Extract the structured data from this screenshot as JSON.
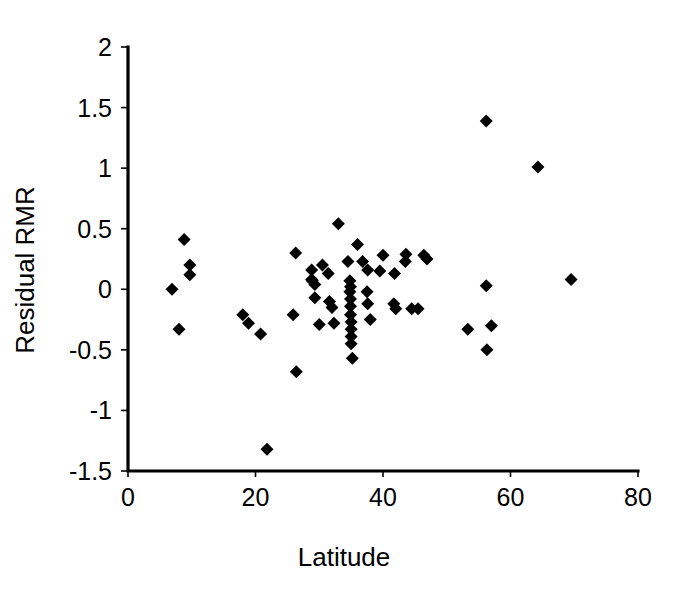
{
  "chart_data": {
    "type": "scatter",
    "title": "",
    "xlabel": "Latitude",
    "ylabel": "Residual RMR",
    "xlim": [
      0,
      80
    ],
    "ylim": [
      -1.5,
      2
    ],
    "xticks": [
      0,
      20,
      40,
      60,
      80
    ],
    "yticks": [
      -1.5,
      -1,
      -0.5,
      0,
      0.5,
      1,
      1.5,
      2
    ],
    "xtick_labels": [
      "0",
      "20",
      "40",
      "60",
      "80"
    ],
    "ytick_labels": [
      "-1.5",
      "-1",
      "-0.5",
      "0",
      "0.5",
      "1",
      "1.5",
      "2"
    ],
    "grid": false,
    "legend": false,
    "marker": "diamond",
    "marker_color": "#000000",
    "marker_size": 13,
    "series": [
      {
        "name": "Residual RMR",
        "points": [
          [
            8.8,
            0.41
          ],
          [
            9.7,
            0.2
          ],
          [
            9.7,
            0.12
          ],
          [
            6.9,
            0.0
          ],
          [
            8.0,
            -0.33
          ],
          [
            18.0,
            -0.21
          ],
          [
            18.9,
            -0.28
          ],
          [
            20.8,
            -0.37
          ],
          [
            21.8,
            -1.32
          ],
          [
            25.9,
            -0.21
          ],
          [
            26.4,
            -0.68
          ],
          [
            26.3,
            0.3
          ],
          [
            28.8,
            0.16
          ],
          [
            28.8,
            0.08
          ],
          [
            28.9,
            0.07
          ],
          [
            29.3,
            0.04
          ],
          [
            29.3,
            -0.07
          ],
          [
            30.0,
            -0.29
          ],
          [
            30.5,
            0.2
          ],
          [
            31.4,
            0.13
          ],
          [
            31.6,
            -0.1
          ],
          [
            32.0,
            -0.15
          ],
          [
            32.3,
            -0.28
          ],
          [
            33.0,
            0.54
          ],
          [
            34.5,
            0.23
          ],
          [
            34.8,
            0.07
          ],
          [
            34.9,
            0.02
          ],
          [
            34.8,
            -0.02
          ],
          [
            34.9,
            -0.08
          ],
          [
            34.9,
            -0.14
          ],
          [
            34.9,
            -0.21
          ],
          [
            35.0,
            -0.27
          ],
          [
            35.0,
            -0.33
          ],
          [
            35.0,
            -0.39
          ],
          [
            35.0,
            -0.45
          ],
          [
            35.2,
            -0.57
          ],
          [
            36.0,
            0.37
          ],
          [
            36.8,
            0.23
          ],
          [
            37.6,
            0.16
          ],
          [
            37.5,
            -0.02
          ],
          [
            37.6,
            -0.12
          ],
          [
            38.0,
            -0.25
          ],
          [
            39.5,
            0.15
          ],
          [
            40.0,
            0.28
          ],
          [
            41.8,
            0.13
          ],
          [
            41.7,
            -0.12
          ],
          [
            42.0,
            -0.16
          ],
          [
            43.6,
            0.29
          ],
          [
            43.5,
            0.23
          ],
          [
            44.5,
            -0.16
          ],
          [
            45.5,
            -0.16
          ],
          [
            46.4,
            0.28
          ],
          [
            46.9,
            0.25
          ],
          [
            53.3,
            -0.33
          ],
          [
            56.2,
            1.39
          ],
          [
            56.2,
            0.03
          ],
          [
            57.0,
            -0.3
          ],
          [
            56.3,
            -0.5
          ],
          [
            64.3,
            1.01
          ],
          [
            69.5,
            0.08
          ]
        ]
      }
    ]
  }
}
